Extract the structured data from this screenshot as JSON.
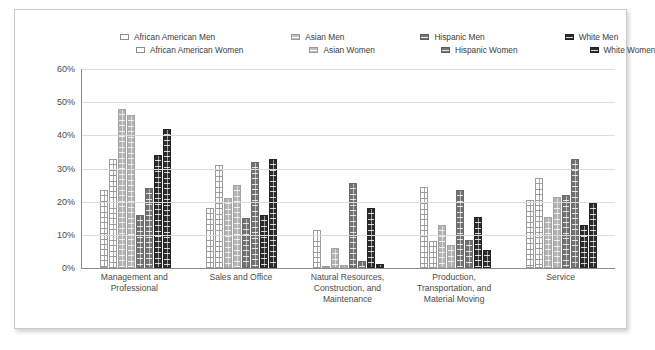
{
  "chart_data": {
    "type": "bar",
    "title": "",
    "subtitle": "",
    "xlabel": "",
    "ylabel": "",
    "ylim": [
      0,
      60
    ],
    "ytick_labels": [
      "60%",
      "50%",
      "40%",
      "30%",
      "20%",
      "10%",
      "0%"
    ],
    "ytick_values": [
      60,
      50,
      40,
      30,
      20,
      10,
      0
    ],
    "grid": true,
    "legend_position": "top",
    "categories": [
      "Management and Professional",
      "Sales and Office",
      "Natural Resources, Construction, and Maintenance",
      "Production, Transportation, and Material Moving",
      "Service"
    ],
    "series": [
      {
        "name": "African American Men",
        "key": "aa",
        "values": [
          23.5,
          18.0,
          11.5,
          24.5,
          20.5
        ]
      },
      {
        "name": "African American Women",
        "key": "aa",
        "values": [
          33.0,
          31.0,
          0.7,
          8.0,
          27.0
        ]
      },
      {
        "name": "Asian Men",
        "key": "as",
        "values": [
          48.0,
          21.0,
          6.0,
          13.0,
          15.5
        ]
      },
      {
        "name": "Asian Women",
        "key": "as",
        "values": [
          46.0,
          25.0,
          1.0,
          7.0,
          21.5
        ]
      },
      {
        "name": "Hispanic Men",
        "key": "hi",
        "values": [
          16.0,
          15.0,
          25.5,
          23.5,
          22.0
        ]
      },
      {
        "name": "Hispanic Women",
        "key": "hi",
        "values": [
          24.0,
          32.0,
          2.0,
          8.5,
          33.0
        ]
      },
      {
        "name": "White Men",
        "key": "wh",
        "values": [
          34.0,
          16.0,
          18.0,
          15.5,
          13.0
        ]
      },
      {
        "name": "White Women",
        "key": "wh",
        "values": [
          42.0,
          33.0,
          1.2,
          5.5,
          19.5
        ]
      }
    ]
  },
  "legend": {
    "row1": [
      {
        "label": "African American Men",
        "swatch": "african-american-swatch",
        "key": "aa"
      },
      {
        "label": "Asian Men",
        "swatch": "asian-swatch",
        "key": "as"
      },
      {
        "label": "Hispanic Men",
        "swatch": "hispanic-swatch",
        "key": "hi"
      },
      {
        "label": "White Men",
        "swatch": "white-swatch",
        "key": "wh"
      }
    ],
    "row2": [
      {
        "label": "African American Women",
        "swatch": "african-american-swatch",
        "key": "aa"
      },
      {
        "label": "Asian Women",
        "swatch": "asian-swatch",
        "key": "as"
      },
      {
        "label": "Hispanic Women",
        "swatch": "hispanic-swatch",
        "key": "hi"
      },
      {
        "label": "White Women",
        "swatch": "white-swatch",
        "key": "wh"
      }
    ]
  },
  "colors": {
    "african_american": "#ffffff",
    "asian": "#b0b0b0",
    "hispanic": "#6b6b6b",
    "white": "#262626",
    "axis": "#8c8c8c",
    "gridline": "#dcdcdc",
    "text": "#4a4a4a",
    "frame_border": "#c9c9c9"
  },
  "xlabels": [
    "Management and\nProfessional",
    "Sales and Office",
    "Natural Resources,\nConstruction, and\nMaintenance",
    "Production,\nTransportation, and\nMaterial Moving",
    "Service"
  ]
}
